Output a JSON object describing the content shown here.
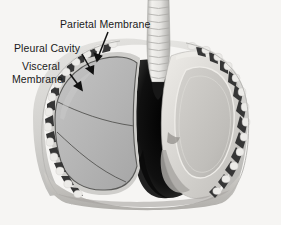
{
  "figure": {
    "background_color": "#f6f5f3",
    "style": "grayscale-medical-illustration"
  },
  "labels": [
    {
      "id": "parietal",
      "text": "Parietal Membrane",
      "x": 60,
      "y": 18,
      "arrow": {
        "from_x": 108,
        "from_y": 32,
        "to_x": 97,
        "to_y": 60
      }
    },
    {
      "id": "pleural",
      "text": "Pleural Cavity",
      "x": 14,
      "y": 42,
      "arrow": {
        "from_x": 82,
        "from_y": 54,
        "to_x": 92,
        "to_y": 73
      }
    },
    {
      "id": "visceral",
      "line1": "Visceral",
      "line2": "Membrane",
      "x": 22,
      "y": 60,
      "arrow": {
        "from_x": 70,
        "from_y": 74,
        "to_x": 81,
        "to_y": 90
      }
    }
  ],
  "anatomy": {
    "parts": [
      "trachea",
      "left-lung",
      "right-lung-cutaway",
      "rib-cage-left",
      "rib-cage-right",
      "mediastinum",
      "diaphragm",
      "pleural-cavity",
      "visceral-membrane",
      "parietal-membrane"
    ],
    "lung_lobes_visible": 3,
    "trachea_cartilage_rings": 11,
    "rib_segments_left": 13,
    "rib_segments_right": 12
  },
  "colors": {
    "background": "#f6f5f3",
    "lung_fill": "#b6b6b6",
    "lung_fill_light": "#c8c8c8",
    "chest_wall": "#d8d8d6",
    "rib_dark": "#3a3a3a",
    "rib_pad": "#e8e7e4",
    "mediastinum_dark": "#111111",
    "trachea": "#ededea",
    "outline": "#4a4a4a",
    "label_text": "#1a1a1a",
    "arrow": "#111111"
  }
}
